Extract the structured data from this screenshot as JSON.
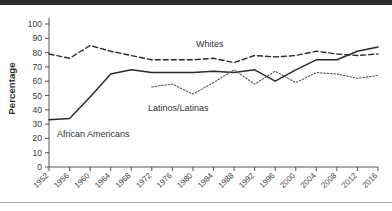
{
  "figure": {
    "ylabel": "Percentage",
    "series_labels": {
      "african_americans": "African Americans",
      "whites": "Whites",
      "latinos": "Latinos/Latinas"
    }
  },
  "chart_data": {
    "type": "line",
    "title": "",
    "xlabel": "",
    "ylabel": "Percentage",
    "ylim": [
      0,
      100
    ],
    "ytick_labels": [
      "0",
      "10",
      "20",
      "30",
      "40",
      "50",
      "60",
      "70",
      "80",
      "90",
      "100"
    ],
    "yticks": [
      0,
      10,
      20,
      30,
      40,
      50,
      60,
      70,
      80,
      90,
      100
    ],
    "grid": false,
    "legend": "inline-annotations",
    "categories": [
      1952,
      1956,
      1960,
      1964,
      1968,
      1972,
      1976,
      1980,
      1984,
      1988,
      1992,
      1996,
      2000,
      2004,
      2008,
      2012,
      2016
    ],
    "x": [
      "1952",
      "1956",
      "1960",
      "1964",
      "1968",
      "1972",
      "1976",
      "1980",
      "1984",
      "1988",
      "1992",
      "1996",
      "2000",
      "2004",
      "2008",
      "2012",
      "2016"
    ],
    "series": [
      {
        "name": "Whites",
        "style": "dashed",
        "color": "#2b2b2b",
        "values": [
          79,
          76,
          85,
          81,
          78,
          75,
          75,
          75,
          76,
          73,
          78,
          77,
          78,
          81,
          79,
          78,
          79
        ]
      },
      {
        "name": "African Americans",
        "style": "solid",
        "color": "#2b2b2b",
        "values": [
          33,
          34,
          49,
          65,
          68,
          66,
          66,
          66,
          67,
          66,
          68,
          60,
          68,
          75,
          75,
          81,
          84
        ]
      },
      {
        "name": "Latinos/Latinas",
        "style": "dotted",
        "color": "#555555",
        "values": [
          null,
          null,
          null,
          null,
          null,
          56,
          58,
          51,
          59,
          68,
          58,
          67,
          59,
          66,
          65,
          62,
          64
        ]
      }
    ]
  }
}
